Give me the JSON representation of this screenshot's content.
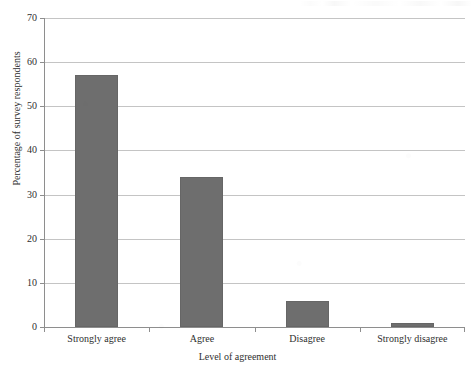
{
  "chart_data": {
    "type": "bar",
    "title": "",
    "subtitle": "",
    "xlabel": "Level of agreement",
    "ylabel": "Percentage of survey respondents",
    "categories": [
      "Strongly agree",
      "Agree",
      "Disagree",
      "Strongly disagree"
    ],
    "values": [
      57,
      34,
      6,
      1
    ],
    "ylim": [
      0,
      70
    ],
    "yticks": [
      0,
      10,
      20,
      30,
      40,
      50,
      60,
      70
    ],
    "ytick_labels": [
      "0",
      "10",
      "20",
      "30",
      "40",
      "50",
      "60",
      "70"
    ],
    "grid": true,
    "grid_axis": "y",
    "legend": false,
    "legend_position": "none",
    "bar_color": "#6e6e6e",
    "gridline_color": "#c4c4c4",
    "axis_color": "#8e8e8e",
    "series": [
      {
        "name": "Percentage of survey respondents",
        "values": [
          57,
          34,
          6,
          1
        ]
      }
    ]
  }
}
